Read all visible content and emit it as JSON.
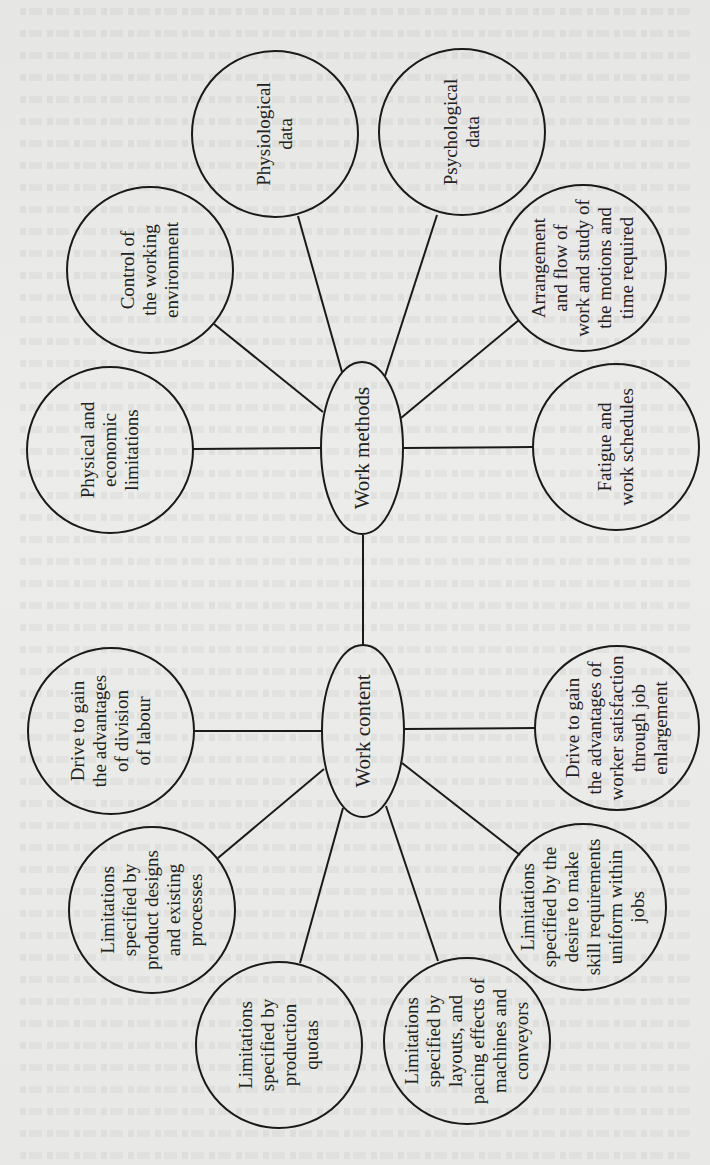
{
  "diagram": {
    "orientation": "rotated-90-ccw",
    "hubs": [
      {
        "id": "work-methods",
        "label": "Work methods",
        "cx": 362,
        "cy": 448,
        "rx": 41,
        "ry": 86
      },
      {
        "id": "work-content",
        "label": "Work content",
        "cx": 363,
        "cy": 731,
        "rx": 41,
        "ry": 86
      }
    ],
    "nodes": [
      {
        "id": "physiological-data",
        "hub": "work-methods",
        "cx": 275,
        "cy": 134,
        "r": 83,
        "lines": [
          "Physiological",
          "data"
        ]
      },
      {
        "id": "psychological-data",
        "hub": "work-methods",
        "cx": 462,
        "cy": 132,
        "r": 83,
        "lines": [
          "Psychological",
          "data"
        ]
      },
      {
        "id": "control-working-environment",
        "hub": "work-methods",
        "cx": 150,
        "cy": 270,
        "r": 83,
        "lines": [
          "Control of",
          "the working",
          "environment"
        ]
      },
      {
        "id": "physical-economic-limitations",
        "hub": "work-methods",
        "cx": 110,
        "cy": 450,
        "r": 83,
        "lines": [
          "Physical and",
          "economic",
          "limitations"
        ]
      },
      {
        "id": "arrangement-flow-work",
        "hub": "work-methods",
        "cx": 583,
        "cy": 268,
        "r": 83,
        "lines": [
          "Arrangement",
          "and flow of",
          "work and study of",
          "the motions and",
          "time required"
        ]
      },
      {
        "id": "fatigue-work-schedules",
        "hub": "work-methods",
        "cx": 616,
        "cy": 447,
        "r": 83,
        "lines": [
          "Fatigue and",
          "work schedules"
        ]
      },
      {
        "id": "drive-division-of-labour",
        "hub": "work-content",
        "cx": 111,
        "cy": 731,
        "r": 83,
        "lines": [
          "Drive to gain",
          "the advantages",
          "of division",
          "of labour"
        ]
      },
      {
        "id": "limitations-product-designs",
        "hub": "work-content",
        "cx": 152,
        "cy": 910,
        "r": 83,
        "lines": [
          "Limitations",
          "specified by",
          "product designs",
          "and existing",
          "processes"
        ]
      },
      {
        "id": "limitations-production-quotas",
        "hub": "work-content",
        "cx": 279,
        "cy": 1045,
        "r": 83,
        "lines": [
          "Limitations",
          "specified by",
          "production",
          "quotas"
        ]
      },
      {
        "id": "limitations-layouts-pacing",
        "hub": "work-content",
        "cx": 467,
        "cy": 1041,
        "r": 83,
        "lines": [
          "Limitations",
          "specified by",
          "layouts, and",
          "pacing effects of",
          "machines and",
          "conveyors"
        ]
      },
      {
        "id": "limitations-skill-requirements",
        "hub": "work-content",
        "cx": 583,
        "cy": 907,
        "r": 83,
        "lines": [
          "Limitations",
          "specified by the",
          "desire to make",
          "skill requirements",
          "uniform within",
          "jobs"
        ]
      },
      {
        "id": "drive-worker-satisfaction",
        "hub": "work-content",
        "cx": 617,
        "cy": 728,
        "r": 82,
        "lines": [
          "Drive to gain",
          "the advantages of",
          "worker satisfaction",
          "through job",
          "enlargement"
        ]
      }
    ],
    "edges": [
      {
        "from": "work-methods",
        "to": "work-content",
        "x1": 363,
        "y1": 535,
        "x2": 363,
        "y2": 646
      },
      {
        "from": "physiological-data",
        "to": "work-methods",
        "x1": 298,
        "y1": 216,
        "x2": 342,
        "y2": 372
      },
      {
        "from": "psychological-data",
        "to": "work-methods",
        "x1": 437,
        "y1": 215,
        "x2": 385,
        "y2": 376
      },
      {
        "from": "control-working-environment",
        "to": "work-methods",
        "x1": 214,
        "y1": 324,
        "x2": 323,
        "y2": 412
      },
      {
        "from": "physical-economic-limitations",
        "to": "work-methods",
        "x1": 193,
        "y1": 449,
        "x2": 321,
        "y2": 448
      },
      {
        "from": "arrangement-flow-work",
        "to": "work-methods",
        "x1": 519,
        "y1": 320,
        "x2": 401,
        "y2": 418
      },
      {
        "from": "fatigue-work-schedules",
        "to": "work-methods",
        "x1": 533,
        "y1": 447,
        "x2": 403,
        "y2": 448
      },
      {
        "from": "drive-division-of-labour",
        "to": "work-content",
        "x1": 194,
        "y1": 731,
        "x2": 322,
        "y2": 731
      },
      {
        "from": "limitations-product-designs",
        "to": "work-content",
        "x1": 218,
        "y1": 858,
        "x2": 324,
        "y2": 769
      },
      {
        "from": "limitations-production-quotas",
        "to": "work-content",
        "x1": 300,
        "y1": 963,
        "x2": 343,
        "y2": 808
      },
      {
        "from": "limitations-layouts-pacing",
        "to": "work-content",
        "x1": 438,
        "y1": 961,
        "x2": 386,
        "y2": 806
      },
      {
        "from": "limitations-skill-requirements",
        "to": "work-content",
        "x1": 520,
        "y1": 855,
        "x2": 402,
        "y2": 763
      },
      {
        "from": "drive-worker-satisfaction",
        "to": "work-content",
        "x1": 535,
        "y1": 728,
        "x2": 404,
        "y2": 729
      }
    ]
  }
}
